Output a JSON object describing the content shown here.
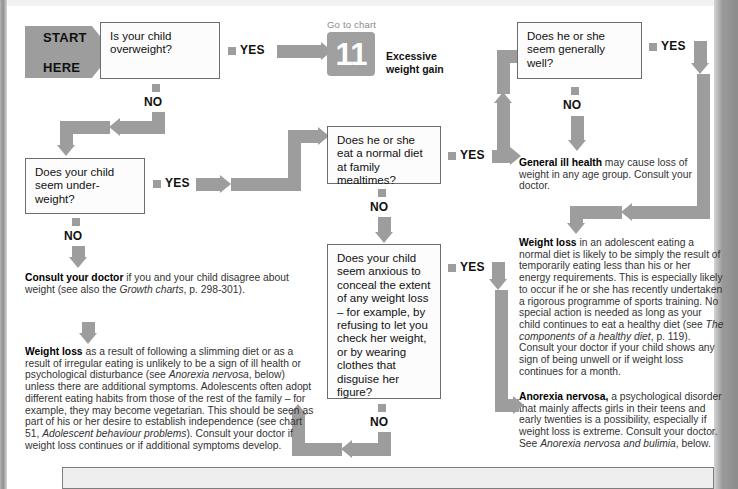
{
  "page": {
    "accent_grey": "#9d9d9d",
    "box_border": "#6d6d6d"
  },
  "start": {
    "label": "START\nHERE",
    "line1": "START",
    "line2": "HERE"
  },
  "questions": [
    {
      "id": "q-overweight",
      "text": "Is your child overweight?"
    },
    {
      "id": "q-underweight",
      "text": "Does your child seem under-weight?"
    },
    {
      "id": "q-normal-diet",
      "text": "Does he or she eat a normal diet at family mealtimes?"
    },
    {
      "id": "q-generally-well",
      "text": "Does he or she seem generally well?"
    },
    {
      "id": "q-conceal",
      "text": "Does your child seem anxious to conceal the extent of any weight loss – for example, by refusing to let you check her weight, or by wearing clothes that disguise her figure?"
    }
  ],
  "labels": {
    "yes": "YES",
    "no": "NO"
  },
  "chart_ref": {
    "go_to_chart": "Go to chart",
    "number": "11",
    "caption_line1": "Excessive",
    "caption_line2": "weight gain"
  },
  "advice": {
    "consult_doctor": {
      "lead": "Consult your doctor",
      "body": " if you and your child disagree about weight (see also the ",
      "italic": "Growth charts",
      "tail": ", p. 298-301)."
    },
    "weight_loss_left": {
      "lead": "Weight loss",
      "p1": " as a result of following a slimming diet or as a result of irregular eating is unlikely to be a sign of ill health or psychological disturbance (see ",
      "i1": "Anorexia nervosa",
      "p2": ", below) unless there are additional symptoms. Adolescents often adopt different eating habits from those of the rest of the family – for example, they may become vegetarian. This should be seen as part of his or her desire to establish independence (see chart 51, ",
      "i2": "Adolescent behaviour problems",
      "p3": "). Consult your doctor if weight loss continues or if additional symptoms develop."
    },
    "general_ill_health": {
      "lead": "General ill health",
      "body": " may cause loss of weight in any age group. Consult your doctor."
    },
    "weight_loss_right": {
      "lead": "Weight loss",
      "p1": " in an adolescent eating a normal diet is likely to be simply the result of temporarily eating less than his or her energy requirements. This is especially likely to occur if he or she has recently undertaken a rigorous programme of sports training. No special action is needed as long as your child continues to eat a healthy diet (see ",
      "i1": "The components of a healthy diet",
      "p2": ", p. 119). Consult your doctor if your child shows any sign of being unwell or if weight loss continues for a month."
    },
    "anorexia": {
      "lead": "Anorexia nervosa,",
      "p1": " a psychological disorder that mainly affects girls in their teens and early twenties is a possibility, especially if weight loss is extreme. Consult your doctor. See ",
      "i1": "Anorexia nervosa and bulimia",
      "p2": ", below."
    }
  }
}
